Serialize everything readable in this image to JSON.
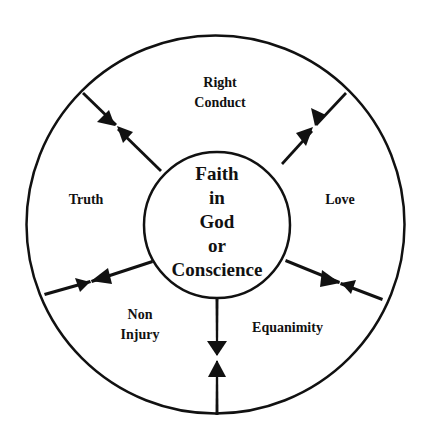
{
  "diagram": {
    "title": "Faith in God or Conscience",
    "center": {
      "lines": [
        "Faith",
        "in",
        "God",
        "or",
        "Conscience"
      ]
    },
    "segments": [
      {
        "id": "right-conduct",
        "lines": [
          "Right",
          "Conduct"
        ]
      },
      {
        "id": "love",
        "lines": [
          "Love"
        ]
      },
      {
        "id": "equanimity",
        "lines": [
          "Equanimity"
        ]
      },
      {
        "id": "non-injury",
        "lines": [
          "Non",
          "Injury"
        ]
      },
      {
        "id": "truth",
        "lines": [
          "Truth"
        ]
      }
    ],
    "colors": {
      "stroke": "#111111",
      "background": "#ffffff"
    }
  }
}
